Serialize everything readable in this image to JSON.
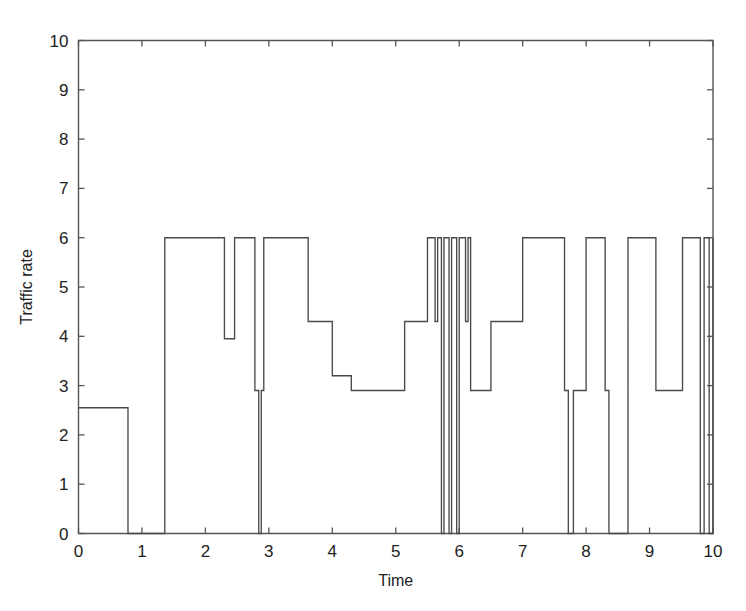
{
  "chart_data": {
    "type": "line",
    "title": "",
    "subtitle": "",
    "xlabel": "Time",
    "ylabel": "Traffic rate",
    "xlim": [
      0,
      10
    ],
    "ylim": [
      0,
      10
    ],
    "xticks": [
      0,
      1,
      2,
      3,
      4,
      5,
      6,
      7,
      8,
      9,
      10
    ],
    "yticks": [
      0,
      1,
      2,
      3,
      4,
      5,
      6,
      7,
      8,
      9,
      10
    ],
    "xtick_labels": [
      "0",
      "1",
      "2",
      "3",
      "4",
      "5",
      "6",
      "7",
      "8",
      "9",
      "10"
    ],
    "ytick_labels": [
      "0",
      "1",
      "2",
      "3",
      "4",
      "5",
      "6",
      "7",
      "8",
      "9",
      "10"
    ],
    "grid": false,
    "legend": false,
    "legend_position": "none",
    "line_color": "#4a4a4a",
    "box_color": "#555555",
    "drawstyle": "steps-post",
    "series": [
      {
        "name": "Traffic rate",
        "comment": "Piecewise-constant (step) signal of traffic rate versus time; breakpoints are (x, y) pairs where y holds constant until the next x.",
        "x": [
          0.0,
          0.78,
          1.36,
          2.3,
          2.46,
          2.78,
          2.84,
          2.88,
          2.92,
          3.62,
          4.0,
          4.3,
          4.66,
          5.14,
          5.5,
          5.62,
          5.66,
          5.72,
          5.76,
          5.84,
          5.88,
          5.96,
          6.0,
          6.1,
          6.14,
          6.18,
          6.4,
          6.5,
          6.9,
          7.0,
          7.66,
          7.72,
          7.8,
          8.0,
          8.3,
          8.36,
          8.66,
          9.1,
          9.18,
          9.52,
          9.6,
          9.8,
          9.86,
          9.94,
          10.0
        ],
        "y": [
          2.55,
          0.0,
          6.0,
          3.95,
          6.0,
          2.9,
          0.0,
          2.9,
          6.0,
          4.3,
          3.2,
          2.9,
          2.9,
          4.3,
          6.0,
          4.3,
          6.0,
          0.0,
          6.0,
          0.0,
          6.0,
          0.0,
          6.0,
          4.3,
          6.0,
          2.9,
          2.9,
          4.3,
          4.3,
          6.0,
          2.9,
          0.0,
          2.9,
          6.0,
          2.9,
          0.0,
          6.0,
          2.9,
          2.9,
          6.0,
          6.0,
          0.0,
          6.0,
          0.0,
          6.0
        ]
      }
    ]
  },
  "axes": {
    "y_axis_title": "Traffic rate",
    "x_axis_title": "Time"
  }
}
